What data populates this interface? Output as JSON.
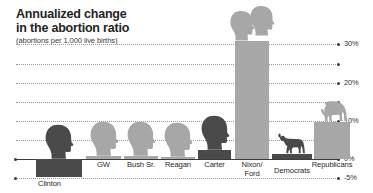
{
  "title": {
    "line1": "Annualized change",
    "line2": "in the abortion ratio",
    "subtitle": "(abortions per 1,000 live births)"
  },
  "axis": {
    "ticks": [
      {
        "label": "30%",
        "value": 30,
        "labeled": true
      },
      {
        "label": "",
        "value": 25,
        "labeled": false
      },
      {
        "label": "20%",
        "value": 20,
        "labeled": true
      },
      {
        "label": "",
        "value": 15,
        "labeled": false
      },
      {
        "label": "10%",
        "value": 10,
        "labeled": true
      },
      {
        "label": "",
        "value": 5,
        "labeled": false
      },
      {
        "label": "0%",
        "value": 0,
        "labeled": true
      },
      {
        "label": "-5%",
        "value": -5,
        "labeled": true
      }
    ],
    "ylim": [
      -5,
      33
    ],
    "unit": "%"
  },
  "chart_data": {
    "type": "bar",
    "title": "Annualized change in the abortion ratio",
    "subtitle": "(abortions per 1,000 live births)",
    "xlabel": "",
    "ylabel": "Annualized change (%)",
    "ylim": [
      -5,
      33
    ],
    "grid": true,
    "legend": "none",
    "categories": [
      "Clinton",
      "GW",
      "Bush Sr.",
      "Reagan",
      "Carter",
      "Nixon/Ford",
      "Democrats",
      "Republicans"
    ],
    "values": [
      -4.6,
      0.7,
      0.8,
      0.5,
      2.3,
      31.0,
      1.2,
      9.8
    ],
    "party": [
      "dem",
      "rep",
      "rep",
      "rep",
      "dem",
      "rep",
      "dem",
      "rep"
    ],
    "annotations": [
      "Presidential silhouettes sit atop each president's bar",
      "Donkey icon marks the Democrats aggregate bar",
      "Elephant icon marks the Republicans aggregate bar"
    ]
  },
  "bars": [
    {
      "key": "clinton",
      "label": "Clinton",
      "value": -4.6,
      "party": "dem",
      "icon": "head-silhouette",
      "x": 36,
      "w": 46
    },
    {
      "key": "gw",
      "label": "GW",
      "value": 0.7,
      "party": "rep",
      "icon": "head-silhouette",
      "x": 86,
      "w": 35
    },
    {
      "key": "bushsr",
      "label": "Bush Sr.",
      "value": 0.8,
      "party": "rep",
      "icon": "head-silhouette",
      "x": 124,
      "w": 34
    },
    {
      "key": "reagan",
      "label": "Reagan",
      "value": 0.5,
      "party": "rep",
      "icon": "head-silhouette",
      "x": 161,
      "w": 34
    },
    {
      "key": "carter",
      "label": "Carter",
      "value": 2.3,
      "party": "dem",
      "icon": "head-silhouette",
      "x": 198,
      "w": 33
    },
    {
      "key": "nixonford",
      "label": "Nixon/\nFord",
      "value": 31.0,
      "party": "rep",
      "icon": "head-silhouette-pair",
      "x": 235,
      "w": 34
    },
    {
      "key": "democrats",
      "label": "Democrats",
      "value": 1.2,
      "party": "dem",
      "icon": "donkey-icon",
      "x": 272,
      "w": 40
    },
    {
      "key": "republicans",
      "label": "Republicans",
      "value": 9.8,
      "party": "rep",
      "icon": "elephant-icon",
      "x": 314,
      "w": 36
    }
  ],
  "colors": {
    "democrat": "#4a4a4a",
    "republican": "#a7a7a7",
    "grid": "#9a9a9a",
    "text": "#1f1f1f",
    "background": "#ffffff"
  }
}
